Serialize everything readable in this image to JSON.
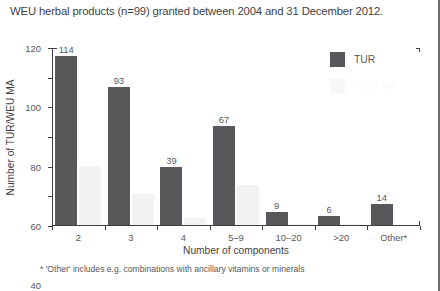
{
  "title": "WEU herbal products (n=99) granted between 2004 and 31 December 2012.",
  "footnote": "* 'Other' includes e.g. combinations with ancillary vitamins or minerals",
  "legend": {
    "items": [
      {
        "label": "TUR",
        "color": "#58585a"
      },
      {
        "label": "WEU MA",
        "color": "#f7f7f7"
      }
    ]
  },
  "chart_data": {
    "type": "bar",
    "title": "WEU herbal products (n=99) granted between 2004 and 31 December 2012.",
    "xlabel": "Number of components",
    "ylabel": "Number of TUR/WEU MA",
    "categories": [
      "2",
      "3",
      "4",
      "5–9",
      "10–20",
      ">20",
      "Other*"
    ],
    "series": [
      {
        "name": "TUR",
        "color": "#58585a",
        "values": [
          114,
          93,
          39,
          67,
          9,
          6,
          14
        ],
        "labels": [
          "114",
          "93",
          "39",
          "67",
          "9",
          "6",
          "14"
        ]
      },
      {
        "name": "WEU MA",
        "color": "#f2f2f2",
        "values": [
          40,
          21,
          5,
          27,
          1,
          1,
          0
        ],
        "labels": [
          "",
          "",
          "",
          "",
          "",
          "",
          ""
        ]
      }
    ],
    "ylim": [
      0,
      120
    ],
    "yticks": [
      0,
      20,
      40,
      60,
      80,
      100,
      120
    ],
    "ytick_labels": [
      "0",
      "20",
      "40",
      "60",
      "80",
      "100",
      "120"
    ],
    "grid": false,
    "legend_position": "top-right",
    "annotations": [
      "* 'Other' includes e.g. combinations with ancillary vitamins or minerals"
    ]
  }
}
